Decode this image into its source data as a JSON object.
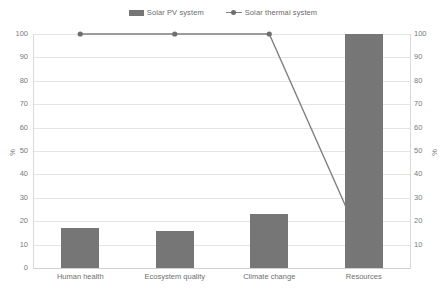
{
  "chart_data": {
    "type": "bar",
    "title": "",
    "xlabel": "",
    "ylabel": "%",
    "y2label": "%",
    "categories": [
      "Human health",
      "Ecosystem quality",
      "Climate change",
      "Resources"
    ],
    "ylim": [
      0,
      100
    ],
    "y2lim": [
      0,
      100
    ],
    "yticks": [
      100,
      90,
      80,
      70,
      60,
      50,
      40,
      30,
      20,
      10,
      0
    ],
    "y2ticks": [
      100,
      90,
      80,
      70,
      60,
      50,
      40,
      30,
      20,
      10
    ],
    "grid": true,
    "legend_position": "top-center",
    "series": [
      {
        "name": "Solar PV system",
        "type": "bar",
        "axis": "left",
        "color": "#767676",
        "values": [
          17,
          16,
          23,
          100
        ]
      },
      {
        "name": "Solar thermal system",
        "type": "line",
        "axis": "left",
        "color": "#808080",
        "marker": "circle",
        "values": [
          100,
          100,
          100,
          9
        ]
      }
    ]
  },
  "legend": {
    "entries": [
      {
        "label": "Solar PV system",
        "swatch": "bar-swatch-icon"
      },
      {
        "label": "Solar thermal system",
        "swatch": "line-marker-icon"
      }
    ]
  }
}
